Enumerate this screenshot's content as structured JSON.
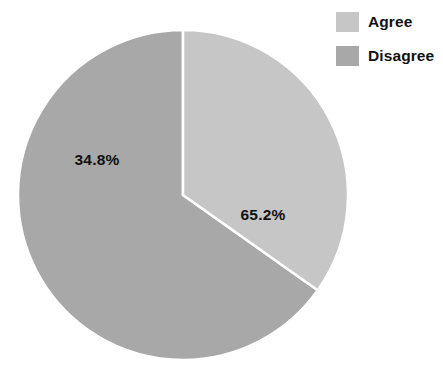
{
  "chart_data": {
    "type": "pie",
    "title": "",
    "categories": [
      "Agree",
      "Disagree"
    ],
    "values": [
      34.8,
      65.2
    ],
    "value_unit": "%",
    "data_labels": [
      "34.8%",
      "65.2%"
    ],
    "colors": [
      "#c6c6c6",
      "#a8a8a8"
    ],
    "start_angle_deg": 0,
    "direction": "clockwise",
    "slice_border_color": "#ffffff",
    "legend_position": "top-right",
    "grid": false,
    "background": "#ffffff",
    "slices": [
      {
        "name": "Agree",
        "value": 34.8,
        "label": "34.8%",
        "color": "#c6c6c6",
        "sweep_deg": 125.3,
        "label_x": 97,
        "label_y": 165
      },
      {
        "name": "Disagree",
        "value": 65.2,
        "label": "65.2%",
        "color": "#a8a8a8",
        "sweep_deg": 234.7,
        "label_x": 263,
        "label_y": 220
      }
    ],
    "geometry": {
      "center_x": 183,
      "center_y": 195,
      "radius": 165
    }
  },
  "legend": {
    "items": [
      {
        "label": "Agree",
        "color": "#c6c6c6"
      },
      {
        "label": "Disagree",
        "color": "#a8a8a8"
      }
    ]
  }
}
